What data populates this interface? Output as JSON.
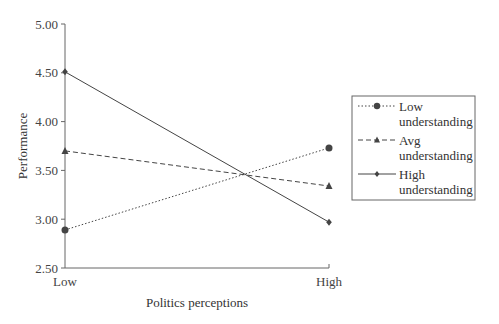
{
  "chart_data": {
    "type": "line",
    "title": "",
    "xlabel": "Politics perceptions",
    "ylabel": "Performance",
    "categories": [
      "Low",
      "High"
    ],
    "ylim": [
      2.5,
      5.0
    ],
    "yticks": [
      "2.50",
      "3.00",
      "3.50",
      "4.00",
      "4.50",
      "5.00"
    ],
    "grid": false,
    "legend_position": "right",
    "series": [
      {
        "name": "Low understanding",
        "line1": "Low",
        "line2": "understanding",
        "values": [
          2.89,
          3.73
        ],
        "linestyle": "dotted",
        "marker": "circle"
      },
      {
        "name": "Avg understanding",
        "line1": "Avg",
        "line2": "understanding",
        "values": [
          3.7,
          3.34
        ],
        "linestyle": "dashed",
        "marker": "triangle"
      },
      {
        "name": "High understanding",
        "line1": "High",
        "line2": "understanding",
        "values": [
          4.51,
          2.97
        ],
        "linestyle": "solid",
        "marker": "diamond"
      }
    ]
  },
  "colors": {
    "line": "#444444",
    "axis": "#555555"
  }
}
